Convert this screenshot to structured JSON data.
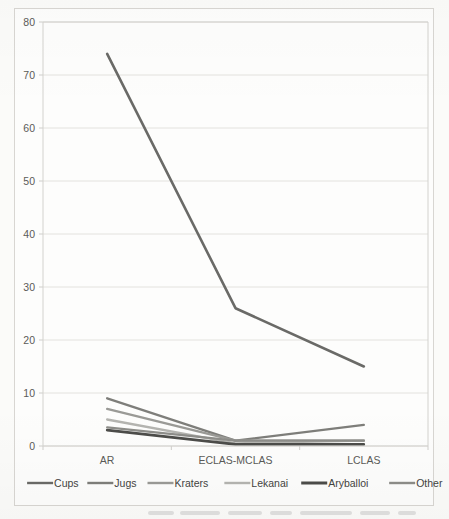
{
  "chart_data": {
    "type": "line",
    "title": "",
    "subtitle": "",
    "xlabel": "",
    "ylabel": "",
    "categories": [
      "AR",
      "ECLAS-MCLAS",
      "LCLAS"
    ],
    "ylim": [
      0,
      80
    ],
    "yticks": [
      0,
      10,
      20,
      30,
      40,
      50,
      60,
      70,
      80
    ],
    "ytick_labels": [
      "0",
      "10",
      "20",
      "30",
      "40",
      "50",
      "60",
      "70",
      "80"
    ],
    "grid": "horizontal",
    "legend_position": "bottom",
    "series": [
      {
        "name": "Cups",
        "values": [
          74,
          26,
          15
        ],
        "color": "#6a6a67",
        "width": 2.6
      },
      {
        "name": "Jugs",
        "values": [
          9,
          1,
          4
        ],
        "color": "#7e7e7a",
        "width": 2.3
      },
      {
        "name": "Kraters",
        "values": [
          7,
          1,
          1
        ],
        "color": "#9a9a96",
        "width": 2.3
      },
      {
        "name": "Lekanai",
        "values": [
          5,
          0.5,
          1
        ],
        "color": "#b4b4b0",
        "width": 2.3
      },
      {
        "name": "Aryballoi",
        "values": [
          3,
          0.3,
          0.3
        ],
        "color": "#4c4c49",
        "width": 2.6
      },
      {
        "name": "Other",
        "values": [
          3.5,
          1,
          1
        ],
        "color": "#8d8d89",
        "width": 2.3
      }
    ]
  },
  "legend": {
    "items": [
      {
        "label": "Cups",
        "color": "#6a6a67"
      },
      {
        "label": "Jugs",
        "color": "#7e7e7a"
      },
      {
        "label": "Kraters",
        "color": "#9a9a96"
      },
      {
        "label": "Lekanai",
        "color": "#b4b4b0"
      },
      {
        "label": "Aryballoi",
        "color": "#4c4c49"
      },
      {
        "label": "Other",
        "color": "#8d8d89"
      }
    ]
  },
  "colors": {
    "page_background": "#fbfbf9",
    "plot_background": "#fdfdfc",
    "frame_border": "#d8d6d2",
    "gridline": "#e3e2de",
    "tick_text": "#5b5b58",
    "legend_text": "#44443f"
  }
}
